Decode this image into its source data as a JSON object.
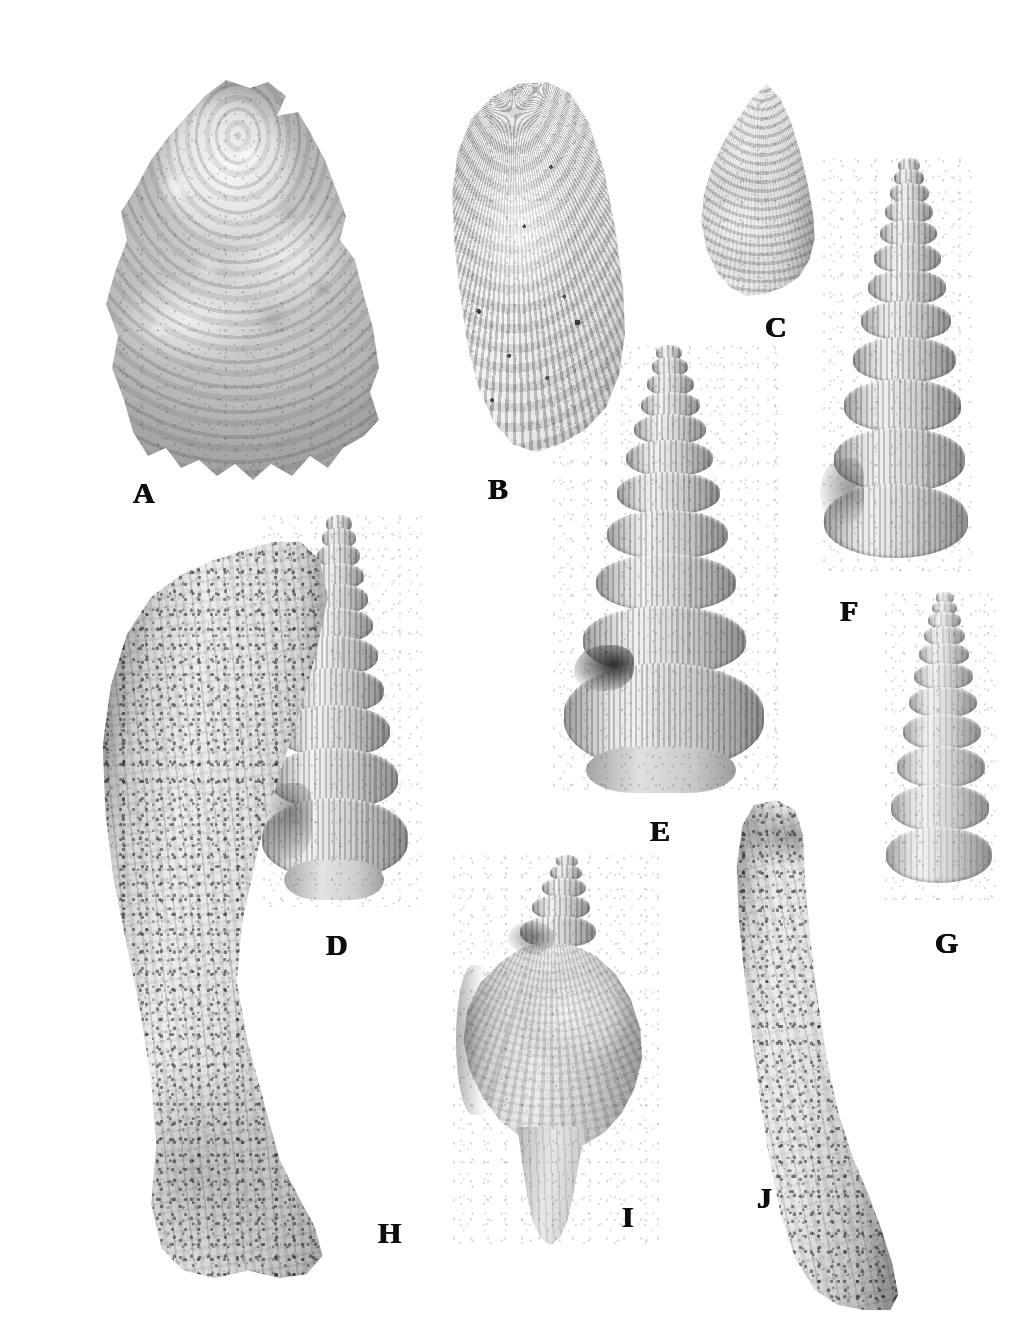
{
  "figure": {
    "kind": "paleontological-plate",
    "background_color": "#ffffff",
    "width": 1036,
    "height": 1323,
    "label_color": "#0d0d0d",
    "panel_count": 10
  },
  "panels": [
    {
      "id": "A",
      "label": "A",
      "label_x": 133,
      "label_y": 478,
      "description": "encrusted irregular bivalve / oyster valve, exterior view",
      "x": 88,
      "y": 80,
      "w": 300,
      "h": 400
    },
    {
      "id": "B",
      "label": "B",
      "label_x": 488,
      "label_y": 474,
      "description": "radially ribbed mytilid bivalve, right valve exterior",
      "x": 437,
      "y": 82,
      "w": 190,
      "h": 370
    },
    {
      "id": "C",
      "label": "C",
      "label_x": 765,
      "label_y": 312,
      "description": "low conical trochid gastropod, apertural view",
      "x": 688,
      "y": 84,
      "w": 132,
      "h": 212
    },
    {
      "id": "D",
      "label": "D",
      "label_x": 326,
      "label_y": 930,
      "description": "turreted cerithiform gastropod with nodose spiral cords",
      "x": 262,
      "y": 515,
      "w": 162,
      "h": 392
    },
    {
      "id": "E",
      "label": "E",
      "label_x": 650,
      "label_y": 816,
      "description": "large turreted gastropod, broad body whorl, apertural view",
      "x": 552,
      "y": 345,
      "w": 230,
      "h": 452
    },
    {
      "id": "F",
      "label": "F",
      "label_x": 840,
      "label_y": 596,
      "description": "slender nodulose turreted gastropod, abapertural view",
      "x": 822,
      "y": 158,
      "w": 152,
      "h": 418
    },
    {
      "id": "G",
      "label": "G",
      "label_x": 935,
      "label_y": 928,
      "description": "small ribbed turritelliform gastropod",
      "x": 884,
      "y": 592,
      "w": 116,
      "h": 308
    },
    {
      "id": "H",
      "label": "H",
      "label_x": 378,
      "label_y": 1218,
      "description": "large curved worn tusk-shell / tube fragment, sediment encrusted",
      "x": 92,
      "y": 538,
      "w": 268,
      "h": 740
    },
    {
      "id": "I",
      "label": "I",
      "label_x": 622,
      "label_y": 1202,
      "description": "fusiform buccinid gastropod with short spire and long canal",
      "x": 452,
      "y": 855,
      "w": 212,
      "h": 390
    },
    {
      "id": "J",
      "label": "J",
      "label_x": 757,
      "label_y": 1183,
      "description": "straight worn tube / scaphopod fragment",
      "x": 712,
      "y": 800,
      "w": 190,
      "h": 510
    }
  ]
}
